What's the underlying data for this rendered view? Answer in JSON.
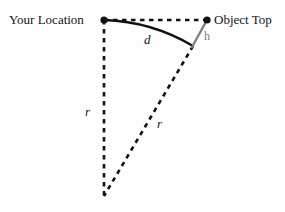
{
  "figure": {
    "background_color": "#fdfdfd",
    "width": 285,
    "height": 212
  },
  "labels": {
    "your_location": "Your Location",
    "object_top": "Object Top",
    "arc_distance": "d",
    "radius_vertical": "r",
    "radius_slant": "r",
    "height": "h"
  },
  "colors": {
    "stroke_primary": "#111111",
    "stroke_height": "#808080",
    "text_primary": "#151515",
    "text_height": "#7d7d7d"
  },
  "geometry": {
    "point_observer": {
      "x": 104,
      "y": 20,
      "name": "Your Location"
    },
    "point_object_top": {
      "x": 207,
      "y": 20,
      "name": "Object Top"
    },
    "point_object_base": {
      "x": 193,
      "y": 46,
      "name": "Object Base on Surface"
    },
    "point_center": {
      "x": 104,
      "y": 196,
      "name": "Earth Center"
    },
    "arc": {
      "from": {
        "x": 104,
        "y": 20
      },
      "to": {
        "x": 193,
        "y": 46
      },
      "control": {
        "x": 152,
        "y": 22
      },
      "style": "solid",
      "label": "d"
    },
    "segments": [
      {
        "name": "line-of-sight",
        "from": {
          "x": 104,
          "y": 20
        },
        "to": {
          "x": 207,
          "y": 20
        },
        "style": "dashed"
      },
      {
        "name": "radius-vertical",
        "from": {
          "x": 104,
          "y": 20
        },
        "to": {
          "x": 104,
          "y": 196
        },
        "style": "dashed",
        "label": "r"
      },
      {
        "name": "radius-slant",
        "from": {
          "x": 193,
          "y": 46
        },
        "to": {
          "x": 104,
          "y": 196
        },
        "style": "dashed",
        "label": "r"
      },
      {
        "name": "object-height",
        "from": {
          "x": 207,
          "y": 20
        },
        "to": {
          "x": 193,
          "y": 46
        },
        "style": "solid-gray",
        "label": "h"
      }
    ],
    "dots": [
      {
        "name": "observer-dot",
        "x": 104,
        "y": 20,
        "radius": 3.6
      },
      {
        "name": "object-top-dot",
        "x": 207,
        "y": 20,
        "radius": 3.6
      }
    ]
  }
}
